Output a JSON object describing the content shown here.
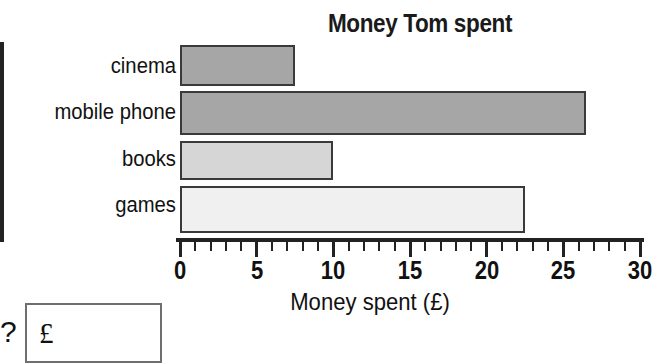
{
  "chart_data": {
    "type": "bar",
    "orientation": "horizontal",
    "title": "Money Tom spent",
    "xlabel": "Money spent (£)",
    "ylabel": "",
    "categories": [
      "cinema",
      "mobile phone",
      "books",
      "games"
    ],
    "values": [
      7.5,
      26.5,
      10,
      22.5
    ],
    "series": [
      {
        "name": "Money spent",
        "values": [
          7.5,
          26.5,
          10,
          22.5
        ]
      }
    ],
    "xlim": [
      0,
      30
    ],
    "xticks": [
      0,
      5,
      10,
      15,
      20,
      25,
      30
    ],
    "xtick_labels": [
      "0",
      "5",
      "10",
      "15",
      "20",
      "25",
      "30"
    ],
    "minor_tick_interval": 1,
    "grid": false,
    "legend": false,
    "bar_colors": [
      "#a6a6a6",
      "#a6a6a6",
      "#d6d6d6",
      "#f0f0f0"
    ],
    "bar_edge_color": "#3a3a3a",
    "axis_color": "#222222"
  },
  "answer": {
    "prompt": "?",
    "currency_symbol": "£",
    "value": ""
  }
}
